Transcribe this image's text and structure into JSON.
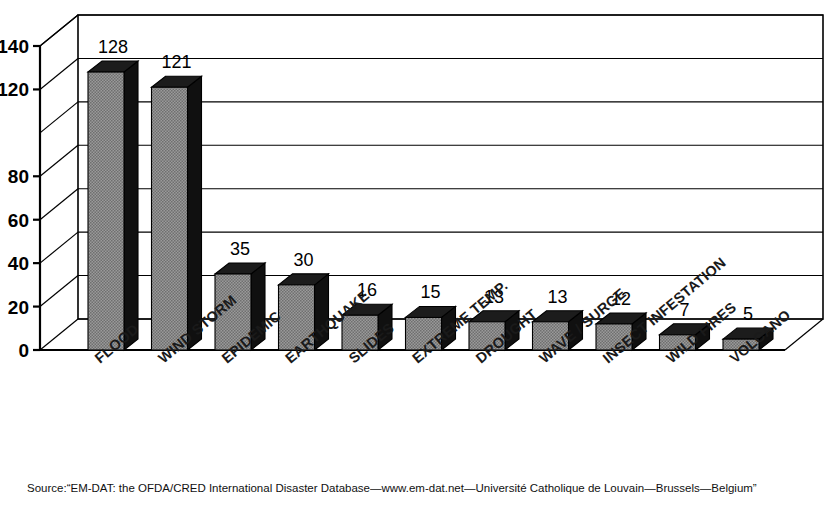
{
  "chart_data": {
    "type": "bar",
    "title": "",
    "subtitle": "",
    "xlabel": "",
    "ylabel": "",
    "ylim": [
      0,
      140
    ],
    "grid": true,
    "legend": false,
    "style_3d": true,
    "categories": [
      "FLOOD",
      "WIND STORM",
      "EPIDEMIC",
      "EARTHQUAKE",
      "SLIDES",
      "EXTREME TEMP.",
      "DROUGHT",
      "WAVE / SURGE",
      "INSECT INFESTATION",
      "WILD FIRES",
      "VOLCANO"
    ],
    "values": [
      128,
      121,
      35,
      30,
      16,
      15,
      13,
      13,
      12,
      7,
      5
    ],
    "y_tick_values": [
      0,
      20,
      40,
      60,
      80,
      120,
      140
    ],
    "y_tick_labels": [
      "0",
      "20",
      "40",
      "60",
      "80",
      "120",
      "140"
    ],
    "gridline_values": [
      0,
      20,
      40,
      60,
      80,
      100,
      120,
      140
    ],
    "bar_face_color": "#8a8a8a",
    "bar_side_color": "#101010",
    "bar_top_color": "#1c1c1c"
  },
  "source": {
    "text": "Source:“EM-DAT: the OFDA/CRED International Disaster Database—www.em-dat.net—Université Catholique de Louvain—Brussels—Belgium”"
  }
}
